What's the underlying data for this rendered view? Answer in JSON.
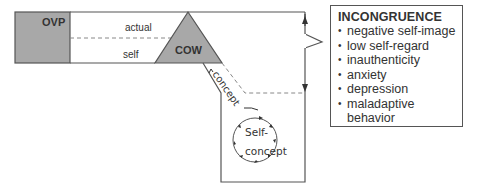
{
  "diagram": {
    "ovp_label": "OVP",
    "actual_label": "actual",
    "self_label": "self",
    "cow_label": "COW",
    "concept_label": "concept",
    "self_concept_line1": "Self-",
    "self_concept_line2": "concept",
    "colors": {
      "ovp_fill": "#a8a8a8",
      "cow_fill": "#a8a8a8",
      "line": "#555555",
      "dashed": "#888888"
    }
  },
  "incongruence": {
    "title": "INCONGRUENCE",
    "items": [
      "negative self-image",
      "low self-regard",
      "inauthenticity",
      "anxiety",
      "depression",
      "maladaptive behavior"
    ]
  }
}
